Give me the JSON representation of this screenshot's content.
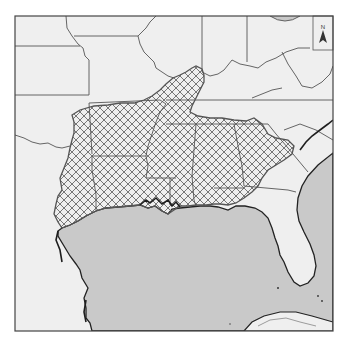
{
  "map": {
    "type": "range-map",
    "description": "Range map of the southeastern United States with a cross-hatched distribution area along the Gulf coastal plain and Mississippi embayment",
    "frame": {
      "x": 15,
      "y": 16,
      "width": 318,
      "height": 315
    },
    "colors": {
      "land": "#efefef",
      "water": "#c9c9c9",
      "border": "#555555",
      "frame": "#444444",
      "coastline": "#222222",
      "hatch": "#666666",
      "range_outline": "#555555"
    },
    "legend": {
      "north_arrow_label": "N"
    },
    "hatched_range": {
      "pattern": "crosshatch",
      "regions": [
        "East Texas",
        "Louisiana",
        "Arkansas",
        "Mississippi",
        "Alabama",
        "Georgia",
        "Tennessee (west)",
        "Missouri bootheel",
        "Illinois (south tip)",
        "Florida panhandle (north)"
      ]
    }
  }
}
